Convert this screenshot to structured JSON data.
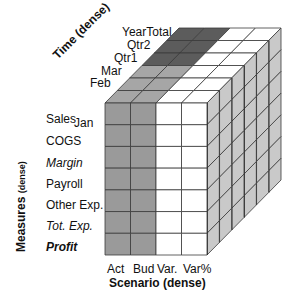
{
  "diagram": {
    "type": "3d-cube",
    "colors": {
      "actual_budget_front": "#9a9a9a",
      "variance_front": "#ffffff",
      "top_recent": "#a6a6a6",
      "top_older": "#5c5c5c",
      "top_variance": "#ffffff",
      "side": "#c9c9c9",
      "grid_line": "#3a3a3a"
    },
    "axes": {
      "time": {
        "title": "Time",
        "title_suffix": "(dense)",
        "members": [
          "Jan",
          "Feb",
          "Mar",
          "Qtr1",
          "Qtr2",
          "YearTotal"
        ]
      },
      "measures": {
        "title": "Measures",
        "title_suffix": "(dense)",
        "members": [
          {
            "label": "Sales",
            "style": "normal"
          },
          {
            "label": "COGS",
            "style": "normal"
          },
          {
            "label": "Margin",
            "style": "italic"
          },
          {
            "label": "Payroll",
            "style": "normal"
          },
          {
            "label": "Other Exp.",
            "style": "normal"
          },
          {
            "label": "Tot. Exp.",
            "style": "italic"
          },
          {
            "label": "Profit",
            "style": "bold-italic"
          }
        ]
      },
      "scenario": {
        "title": "Scenario (dense)",
        "members": [
          "Act",
          "Bud",
          "Var.",
          "Var%"
        ]
      }
    }
  }
}
